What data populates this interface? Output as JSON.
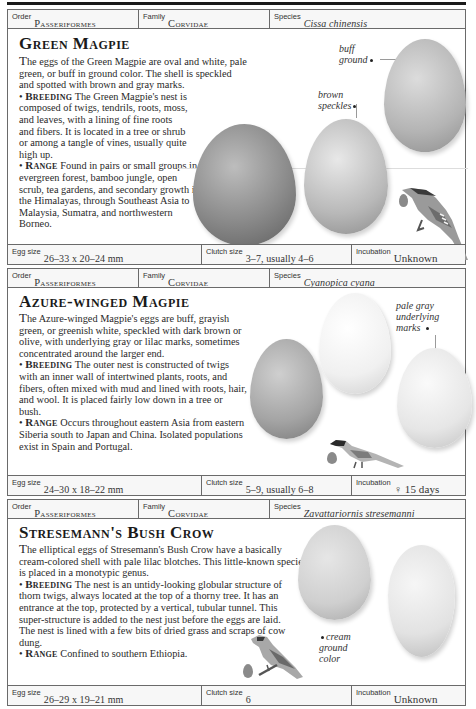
{
  "sections": [
    {
      "header": {
        "order_label": "Order",
        "order": "Passeriformes",
        "family_label": "Family",
        "family": "Corvidae",
        "species_label": "Species",
        "species": "Cissa chinensis"
      },
      "title": "Green Magpie",
      "intro_cap": "T",
      "intro": "he eggs of the Green Magpie are oval and white, pale green, or buff in ground color. The shell is speckled and spotted with brown and gray marks.",
      "breeding_label": "Breeding",
      "breeding": " The Green Magpie's nest is composed of twigs, tendrils, roots, moss, and leaves, with a lining of fine roots and fibers. It is located in a tree or shrub or among a tangle of vines, usually quite high up.",
      "range_label": "Range",
      "range": " Found in pairs or small groups in evergreen forest, bamboo jungle, open scrub, tea gardens, and secondary growth in the Himalayas, through Southeast Asia to Malaysia, Sumatra, and northwestern Borneo.",
      "annotations": [
        "buff ground",
        "brown speckles"
      ],
      "annotation_lines": [
        [
          "buff",
          "ground"
        ],
        [
          "brown",
          "speckles"
        ]
      ],
      "footer": {
        "egg_size_label": "Egg size",
        "egg_size": "26–33 x 20–24 mm",
        "clutch_size_label": "Clutch size",
        "clutch_size": "3–7, usually 4–6",
        "incubation_label": "Incubation",
        "incubation": "Unknown"
      }
    },
    {
      "header": {
        "order_label": "Order",
        "order": "Passeriformes",
        "family_label": "Family",
        "family": "Corvidae",
        "species_label": "Species",
        "species": "Cyanopica cyana"
      },
      "title": "Azure-winged Magpie",
      "intro_cap": "T",
      "intro": "he Azure-winged Magpie's eggs are buff, grayish green, or greenish white, speckled with dark brown or olive, with underlying gray or lilac marks, sometimes concentrated around the larger end.",
      "breeding_label": "Breeding",
      "breeding": " The outer nest is constructed of twigs with an inner wall of intertwined plants, roots, and fibers, often mixed with mud and lined with roots, hair, and wool. It is placed fairly low down in a tree or bush.",
      "range_label": "Range",
      "range": " Occurs throughout eastern Asia from eastern Siberia south to Japan and China. Isolated populations exist in Spain and Portugal.",
      "annotations": [
        "pale gray underlying marks"
      ],
      "annotation_lines": [
        [
          "pale gray",
          "underlying",
          "marks"
        ]
      ],
      "footer": {
        "egg_size_label": "Egg size",
        "egg_size": "24–30 x 18–22 mm",
        "clutch_size_label": "Clutch size",
        "clutch_size": "5–9, usually 6–8",
        "incubation_label": "Incubation",
        "incubation": "♀ 15 days"
      }
    },
    {
      "header": {
        "order_label": "Order",
        "order": "Passeriformes",
        "family_label": "Family",
        "family": "Corvidae",
        "species_label": "Species",
        "species": "Zavattariornis stresemanni"
      },
      "title": "Stresemann's Bush Crow",
      "intro_cap": "T",
      "intro": "he elliptical eggs of Stresemann's Bush Crow have a basically cream-colored shell with pale lilac blotches. This little-known species is placed in a monotypic genus.",
      "breeding_label": "Breeding",
      "breeding": " The nest is an untidy-looking globular structure of thorn twigs, always located at the top of a thorny tree. It has an entrance at the top, protected by a vertical, tubular tunnel. This super-structure is added to the nest just before the eggs are laid. The nest is lined with a few bits of dried grass and scraps of cow dung.",
      "range_label": "Range",
      "range": " Confined to southern Ethiopia.",
      "annotations": [
        "cream ground color"
      ],
      "annotation_lines": [
        [
          "cream",
          "ground",
          "color"
        ]
      ],
      "footer": {
        "egg_size_label": "Egg size",
        "egg_size": "26–29 x 19–21 mm",
        "clutch_size_label": "Clutch size",
        "clutch_size": "6",
        "incubation_label": "Incubation",
        "incubation": "Unknown"
      }
    }
  ],
  "colors": {
    "rule": "#1a1a1a",
    "border": "#6a6a6a",
    "label_row_bg": "#f7f7f7",
    "text": "#2a2a2a"
  }
}
